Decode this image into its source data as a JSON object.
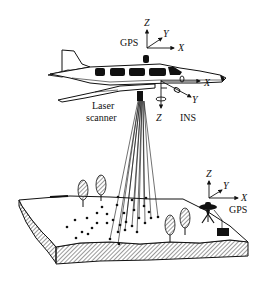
{
  "diagram": {
    "colors": {
      "line": "#111111",
      "background": "#ffffff",
      "hatch": "#555555"
    },
    "aircraft": {
      "gps_label": "GPS",
      "gps_axes": {
        "z": "Z",
        "y": "Y",
        "x": "X"
      },
      "scanner_label_line1": "Laser",
      "scanner_label_line2": "scanner",
      "ins_label": "INS",
      "ins_axes": {
        "x": "X",
        "y": "Y",
        "z": "Z"
      }
    },
    "ground_station": {
      "gps_label": "GPS",
      "gps_axes": {
        "z": "Z",
        "y": "Y",
        "x": "X"
      }
    }
  }
}
